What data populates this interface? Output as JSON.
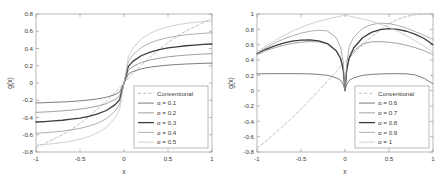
{
  "figure": {
    "background_color": "#ffffff",
    "axis_color": "#9a9a9a",
    "text_color": "#3a3a3a"
  },
  "chart_data": [
    {
      "type": "line",
      "title": "",
      "xlabel": "x",
      "ylabel": "g(x)",
      "xlim": [
        -1,
        1
      ],
      "ylim": [
        -0.8,
        0.8
      ],
      "xticks": [
        -1,
        -0.5,
        0,
        0.5,
        1
      ],
      "xticklabels": [
        "-1",
        "-0.5",
        "0",
        "0.5",
        "1"
      ],
      "yticks": [
        -0.8,
        -0.6,
        -0.4,
        -0.2,
        0,
        0.2,
        0.4,
        0.6,
        0.8
      ],
      "yticklabels": [
        "-0.8",
        "-0.6",
        "-0.4",
        "-0.2",
        "0",
        "0.2",
        "0.4",
        "0.6",
        "0.8"
      ],
      "grid": false,
      "legend_position": "lower right",
      "x": [
        -1,
        -0.9,
        -0.8,
        -0.7,
        -0.6,
        -0.5,
        -0.4,
        -0.3,
        -0.2,
        -0.1,
        -0.05,
        0,
        0.05,
        0.1,
        0.2,
        0.3,
        0.4,
        0.5,
        0.6,
        0.7,
        0.8,
        0.9,
        1
      ],
      "series": [
        {
          "name": "Conventional",
          "style": "dashed",
          "color": "#b8b8b8",
          "width": 0.9,
          "values": [
            -0.75,
            -0.7,
            -0.65,
            -0.6,
            -0.54,
            -0.47,
            -0.39,
            -0.3,
            -0.21,
            -0.11,
            -0.055,
            0,
            0.055,
            0.11,
            0.21,
            0.3,
            0.39,
            0.47,
            0.54,
            0.6,
            0.65,
            0.7,
            0.75
          ]
        },
        {
          "name": "α = 0.1",
          "style": "solid",
          "color": "#6e6e6e",
          "width": 0.9,
          "values": [
            -0.231,
            -0.228,
            -0.224,
            -0.22,
            -0.214,
            -0.207,
            -0.197,
            -0.184,
            -0.165,
            -0.133,
            -0.105,
            0,
            0.105,
            0.133,
            0.165,
            0.184,
            0.197,
            0.207,
            0.214,
            0.22,
            0.224,
            0.228,
            0.231
          ]
        },
        {
          "name": "α = 0.2",
          "style": "solid",
          "color": "#888888",
          "width": 0.8,
          "values": [
            -0.34,
            -0.336,
            -0.33,
            -0.323,
            -0.314,
            -0.303,
            -0.288,
            -0.268,
            -0.239,
            -0.19,
            -0.148,
            0,
            0.148,
            0.19,
            0.239,
            0.268,
            0.288,
            0.303,
            0.314,
            0.323,
            0.33,
            0.336,
            0.34
          ]
        },
        {
          "name": "α = 0.3",
          "style": "solid",
          "color": "#3c3c3c",
          "width": 1.3,
          "values": [
            -0.452,
            -0.447,
            -0.44,
            -0.432,
            -0.42,
            -0.406,
            -0.386,
            -0.359,
            -0.319,
            -0.251,
            -0.192,
            0,
            0.192,
            0.251,
            0.319,
            0.359,
            0.386,
            0.406,
            0.42,
            0.432,
            0.44,
            0.447,
            0.452
          ]
        },
        {
          "name": "α = 0.4",
          "style": "solid",
          "color": "#9a9a9a",
          "width": 0.8,
          "values": [
            -0.582,
            -0.576,
            -0.568,
            -0.558,
            -0.544,
            -0.526,
            -0.501,
            -0.466,
            -0.414,
            -0.326,
            -0.248,
            0,
            0.248,
            0.326,
            0.414,
            0.466,
            0.501,
            0.526,
            0.544,
            0.558,
            0.568,
            0.576,
            0.582
          ]
        },
        {
          "name": "α = 0.5",
          "style": "solid",
          "color": "#c4c4c4",
          "width": 0.8,
          "values": [
            -0.72,
            -0.713,
            -0.703,
            -0.691,
            -0.674,
            -0.652,
            -0.621,
            -0.578,
            -0.514,
            -0.405,
            -0.308,
            0,
            0.308,
            0.405,
            0.514,
            0.578,
            0.621,
            0.652,
            0.674,
            0.691,
            0.703,
            0.713,
            0.72
          ]
        }
      ],
      "endpoint_overrides": {
        "note": "all alpha curves converge near 0.78 at x = 1"
      }
    },
    {
      "type": "line",
      "title": "",
      "xlabel": "x",
      "ylabel": "g(x)",
      "xlim": [
        -1,
        1
      ],
      "ylim": [
        -0.8,
        1.0
      ],
      "xticks": [
        -1,
        -0.5,
        0,
        0.5,
        1
      ],
      "xticklabels": [
        "-1",
        "-0.5",
        "0",
        "0.5",
        "1"
      ],
      "yticks": [
        -0.8,
        -0.6,
        -0.4,
        -0.2,
        0,
        0.2,
        0.4,
        0.6,
        0.8,
        1
      ],
      "yticklabels": [
        "-0.8",
        "-0.6",
        "-0.4",
        "-0.2",
        "0",
        "0.2",
        "0.4",
        "0.6",
        "0.8",
        "1"
      ],
      "grid": false,
      "legend_position": "lower right",
      "x": [
        -1,
        -0.9,
        -0.8,
        -0.7,
        -0.6,
        -0.5,
        -0.4,
        -0.3,
        -0.2,
        -0.1,
        -0.05,
        -0.02,
        0,
        0.02,
        0.05,
        0.1,
        0.2,
        0.3,
        0.4,
        0.5,
        0.6,
        0.7,
        0.8,
        0.9,
        1
      ],
      "series": [
        {
          "name": "Conventional",
          "style": "dashed",
          "color": "#b8b8b8",
          "width": 0.9,
          "values": [
            -0.75,
            -0.66,
            -0.56,
            -0.46,
            -0.35,
            -0.24,
            -0.12,
            0.0,
            0.12,
            0.25,
            0.32,
            0.36,
            0.38,
            0.4,
            0.43,
            0.49,
            0.6,
            0.7,
            0.79,
            0.87,
            0.93,
            0.97,
            0.99,
            1.0,
            1.0
          ]
        },
        {
          "name": "α = 0.6",
          "style": "solid",
          "color": "#6e6e6e",
          "width": 0.9,
          "values": [
            0.22,
            0.221,
            0.222,
            0.222,
            0.222,
            0.221,
            0.218,
            0.212,
            0.2,
            0.168,
            0.135,
            0.085,
            0.0,
            0.085,
            0.135,
            0.168,
            0.2,
            0.212,
            0.218,
            0.221,
            0.222,
            0.22,
            0.205,
            0.16,
            0.09
          ]
        },
        {
          "name": "α = 0.7",
          "style": "solid",
          "color": "#8c8c8c",
          "width": 0.8,
          "values": [
            0.47,
            0.52,
            0.56,
            0.592,
            0.616,
            0.632,
            0.64,
            0.637,
            0.61,
            0.52,
            0.42,
            0.27,
            0.0,
            0.27,
            0.42,
            0.52,
            0.61,
            0.637,
            0.64,
            0.632,
            0.616,
            0.592,
            0.56,
            0.52,
            0.47
          ]
        },
        {
          "name": "α = 0.8",
          "style": "solid",
          "color": "#3c3c3c",
          "width": 1.3,
          "values": [
            0.485,
            0.54,
            0.585,
            0.62,
            0.645,
            0.66,
            0.662,
            0.65,
            0.615,
            0.52,
            0.42,
            0.27,
            0.0,
            0.28,
            0.44,
            0.56,
            0.69,
            0.76,
            0.795,
            0.808,
            0.8,
            0.775,
            0.735,
            0.68,
            0.6
          ]
        },
        {
          "name": "α = 0.9",
          "style": "solid",
          "color": "#9a9a9a",
          "width": 0.8,
          "values": [
            0.49,
            0.56,
            0.62,
            0.672,
            0.715,
            0.75,
            0.775,
            0.788,
            0.78,
            0.69,
            0.57,
            0.37,
            0.0,
            0.37,
            0.58,
            0.7,
            0.81,
            0.862,
            0.88,
            0.875,
            0.85,
            0.815,
            0.77,
            0.72,
            0.67
          ]
        },
        {
          "name": "α = 1",
          "style": "solid",
          "color": "#c4c4c4",
          "width": 0.8,
          "values": [
            0.5,
            0.58,
            0.65,
            0.715,
            0.775,
            0.825,
            0.868,
            0.905,
            0.935,
            0.96,
            0.972,
            0.98,
            0.985,
            0.98,
            0.972,
            0.96,
            0.935,
            0.905,
            0.868,
            0.825,
            0.775,
            0.715,
            0.65,
            0.58,
            0.5
          ]
        }
      ]
    }
  ]
}
